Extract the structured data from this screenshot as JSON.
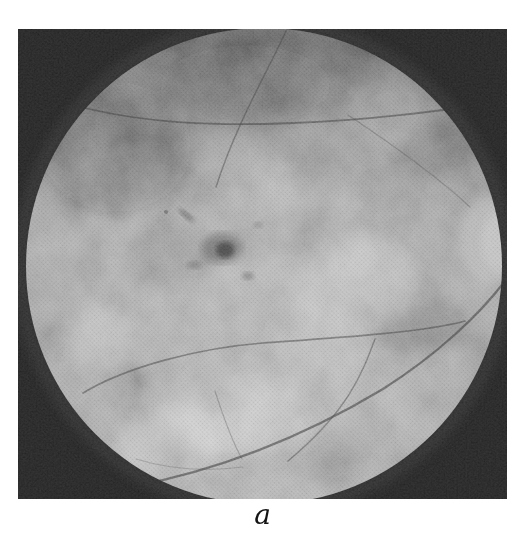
{
  "figure": {
    "label": "a",
    "image": {
      "name": "fundus-photograph",
      "description": "Black-and-white circular retinal fundus photograph on a black square frame: mottled gray retina, darker upper field, central dark macular lesion, thin dark retinal vessels arcing from the right, bright partial optic disc at the right edge"
    },
    "colors": {
      "page_background": "#ffffff",
      "frame_black": "#262626",
      "retina_light_gray": "#a6a6a6",
      "retina_dark_upper": "#787878",
      "vessel_gray": "#3e3e3e",
      "lesion_gray": "#4a4a4a",
      "optic_disc_gray": "#c6c6c6",
      "label_color": "#141414"
    }
  }
}
